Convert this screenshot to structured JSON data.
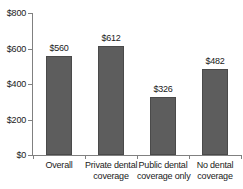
{
  "chart_data": {
    "type": "bar",
    "title": "",
    "subtitle": "",
    "xlabel": "",
    "ylabel": "",
    "categories": [
      "Overall",
      "Private dental coverage",
      "Public dental coverage only",
      "No dental coverage"
    ],
    "category_lines": [
      [
        "Overall"
      ],
      [
        "Private dental",
        "coverage"
      ],
      [
        "Public dental",
        "coverage only"
      ],
      [
        "No dental",
        "coverage"
      ]
    ],
    "values": [
      560,
      612,
      326,
      482
    ],
    "data_labels": [
      "$560",
      "$612",
      "$326",
      "$482"
    ],
    "ylim": [
      0,
      800
    ],
    "ytick_values": [
      0,
      200,
      400,
      600,
      800
    ],
    "ytick_labels": [
      "$0",
      "$200",
      "$400",
      "$600",
      "$800"
    ],
    "grid": false,
    "legend": false,
    "legend_position": "none",
    "bar_color": "#5d5d5d",
    "bar_edge_color": "#4a4a4a",
    "axis_color": "#808080",
    "text_color": "#1a1a1a",
    "background_color": "#ffffff"
  }
}
